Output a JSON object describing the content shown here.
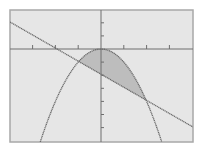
{
  "colors": {
    "background": "#ffffff",
    "screen": "#e6e6e6",
    "frame": "#a8a8a8",
    "axis": "#6e6e6e",
    "curve": "#6a6a6a",
    "shade": "#bdbdbd"
  },
  "chart_data": {
    "type": "line",
    "title": "",
    "xlabel": "",
    "ylabel": "",
    "xlim": [
      -4,
      4
    ],
    "ylim": [
      -7,
      3
    ],
    "grid": false,
    "legend": "none",
    "x_tick_step": 1,
    "y_tick_step": 1,
    "series": [
      {
        "name": "parabola",
        "equation": "y = -x^2",
        "points": [
          [
            -3,
            -9
          ],
          [
            -2,
            -4
          ],
          [
            -1,
            -1
          ],
          [
            0,
            0
          ],
          [
            1,
            -1
          ],
          [
            2,
            -4
          ],
          [
            3,
            -9
          ]
        ]
      },
      {
        "name": "line",
        "equation": "y = -x - 2... approx (slope ~ -0.74)",
        "points": [
          [
            -4,
            2
          ],
          [
            -1,
            -1
          ],
          [
            0,
            -1.9
          ],
          [
            2,
            -4
          ],
          [
            4,
            -6
          ]
        ]
      }
    ],
    "shaded_region": {
      "between": [
        "parabola",
        "line"
      ],
      "x_range": [
        -1,
        2
      ]
    },
    "intersections": [
      [
        -1,
        -1
      ],
      [
        2,
        -4
      ]
    ]
  }
}
